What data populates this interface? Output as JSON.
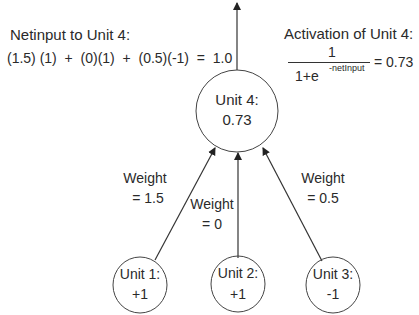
{
  "netinput": {
    "title": "Netinput to Unit 4:",
    "equation": "(1.5) (1)  +  (0)(1)  +  (0.5)(-1)  =  1.0"
  },
  "activation": {
    "title": "Activation of Unit 4:",
    "numerator": "1",
    "denominator_base": "1+e",
    "denominator_exponent": "-netInput",
    "result": "= 0.73"
  },
  "units": {
    "unit4": {
      "name": "Unit 4:",
      "value": "0.73"
    },
    "unit1": {
      "name": "Unit 1:",
      "value": "+1"
    },
    "unit2": {
      "name": "Unit 2:",
      "value": "+1"
    },
    "unit3": {
      "name": "Unit 3:",
      "value": "-1"
    }
  },
  "weights": {
    "w1": {
      "label": "Weight",
      "value": "= 1.5"
    },
    "w2": {
      "label": "Weight",
      "value": "= 0"
    },
    "w3": {
      "label": "Weight",
      "value": "= 0.5"
    }
  },
  "colors": {
    "line": "#333333",
    "text": "#2a2a2a",
    "background": "#ffffff"
  }
}
